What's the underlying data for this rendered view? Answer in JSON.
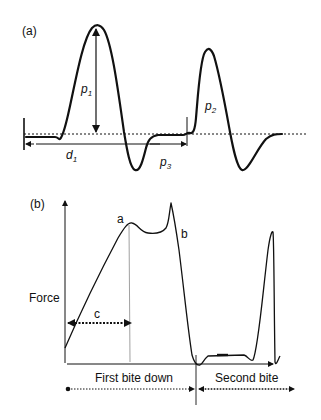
{
  "panel_a": {
    "label": "(a)",
    "annotations": {
      "p1": {
        "base": "p",
        "sub": "1"
      },
      "p2": {
        "base": "p",
        "sub": "2"
      },
      "p3": {
        "base": "p",
        "sub": "3"
      },
      "d1": {
        "base": "d",
        "sub": "1"
      }
    }
  },
  "panel_b": {
    "label": "(b)",
    "y_axis_label": "Force",
    "point_a": "a",
    "point_b": "b",
    "span_c": "c",
    "phase_first": "First bite down",
    "phase_second": "Second bite"
  },
  "colors": {
    "stroke": "#111111",
    "guide": "#888888"
  }
}
